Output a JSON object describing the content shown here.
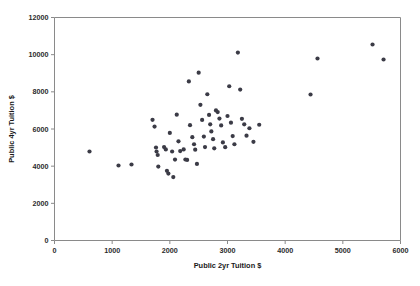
{
  "chart_data": {
    "type": "scatter",
    "title": "",
    "xlabel": "Public 2yr Tuition $",
    "ylabel": "Public 4yr Tuition $",
    "xlim": [
      0,
      6000
    ],
    "ylim": [
      0,
      12000
    ],
    "xticks": [
      0,
      1000,
      2000,
      3000,
      4000,
      5000,
      6000
    ],
    "xtick_labels": [
      "0",
      "1000",
      "2000",
      "3000",
      "4000",
      "5000",
      "6000"
    ],
    "yticks": [
      0,
      2000,
      4000,
      6000,
      8000,
      10000,
      12000
    ],
    "ytick_labels": [
      "0",
      "2000",
      "4000",
      "6000",
      "8000",
      "10000",
      "12000"
    ],
    "grid": false,
    "legend": false,
    "marker": "circle",
    "marker_color": "#3b3b46",
    "marker_size": 2.1,
    "frame_color": "#8a8a8a",
    "background_color": "#ffffff",
    "n_points": 62,
    "points": [
      [
        607,
        4790
      ],
      [
        1110,
        4035
      ],
      [
        1335,
        4090
      ],
      [
        1700,
        6495
      ],
      [
        1735,
        6130
      ],
      [
        1760,
        5005
      ],
      [
        1770,
        4790
      ],
      [
        1790,
        4600
      ],
      [
        1800,
        3980
      ],
      [
        1900,
        5030
      ],
      [
        1930,
        4900
      ],
      [
        1950,
        3750
      ],
      [
        1975,
        3600
      ],
      [
        2000,
        5790
      ],
      [
        2040,
        4790
      ],
      [
        2060,
        3415
      ],
      [
        2090,
        4355
      ],
      [
        2120,
        6770
      ],
      [
        2150,
        5335
      ],
      [
        2180,
        4810
      ],
      [
        2240,
        4900
      ],
      [
        2270,
        4360
      ],
      [
        2300,
        4335
      ],
      [
        2330,
        8560
      ],
      [
        2350,
        6205
      ],
      [
        2390,
        5560
      ],
      [
        2420,
        5180
      ],
      [
        2440,
        4890
      ],
      [
        2470,
        4120
      ],
      [
        2500,
        9030
      ],
      [
        2530,
        7300
      ],
      [
        2560,
        6490
      ],
      [
        2590,
        5590
      ],
      [
        2610,
        5030
      ],
      [
        2650,
        7870
      ],
      [
        2680,
        6760
      ],
      [
        2700,
        6250
      ],
      [
        2720,
        5870
      ],
      [
        2750,
        5450
      ],
      [
        2770,
        4960
      ],
      [
        2800,
        7000
      ],
      [
        2830,
        6910
      ],
      [
        2860,
        6560
      ],
      [
        2890,
        6190
      ],
      [
        2920,
        5280
      ],
      [
        2960,
        5020
      ],
      [
        3000,
        6700
      ],
      [
        3030,
        8300
      ],
      [
        3060,
        6340
      ],
      [
        3090,
        5620
      ],
      [
        3120,
        5180
      ],
      [
        3180,
        10110
      ],
      [
        3220,
        8120
      ],
      [
        3250,
        6550
      ],
      [
        3290,
        6250
      ],
      [
        3330,
        5640
      ],
      [
        3380,
        6040
      ],
      [
        3450,
        5310
      ],
      [
        3550,
        6230
      ],
      [
        4440,
        7857
      ],
      [
        4561,
        9794
      ],
      [
        5515,
        10546
      ],
      [
        5706,
        9740
      ]
    ]
  },
  "axes": {
    "x_axis_label": "Public 2yr Tuition $",
    "y_axis_label": "Public 4yr Tuition $"
  }
}
